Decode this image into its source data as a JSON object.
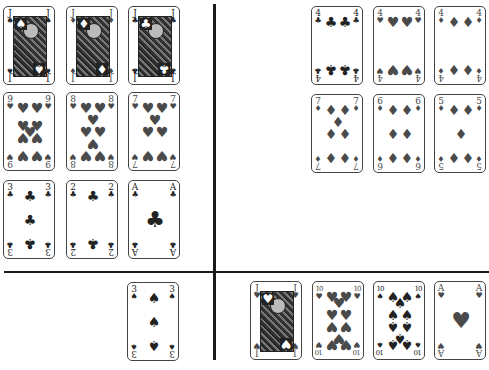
{
  "layout": {
    "divider_vertical": {
      "x": 213
    },
    "divider_horizontal": {
      "y": 271
    }
  },
  "quadrants": {
    "top_left": {
      "rows": [
        [
          {
            "rank": "J",
            "suit": "♠",
            "suit_name": "spades"
          },
          {
            "rank": "J",
            "suit": "♦",
            "suit_name": "diamonds"
          },
          {
            "rank": "J",
            "suit": "♣",
            "suit_name": "clubs"
          }
        ],
        [
          {
            "rank": "9",
            "suit": "♥",
            "suit_name": "hearts"
          },
          {
            "rank": "8",
            "suit": "♥",
            "suit_name": "hearts"
          },
          {
            "rank": "7",
            "suit": "♥",
            "suit_name": "hearts"
          }
        ],
        [
          {
            "rank": "3",
            "suit": "♣",
            "suit_name": "clubs"
          },
          {
            "rank": "2",
            "suit": "♣",
            "suit_name": "clubs"
          },
          {
            "rank": "A",
            "suit": "♣",
            "suit_name": "clubs"
          }
        ]
      ]
    },
    "top_right": {
      "rows": [
        [
          {
            "rank": "4",
            "suit": "♣",
            "suit_name": "clubs"
          },
          {
            "rank": "4",
            "suit": "♥",
            "suit_name": "hearts"
          },
          {
            "rank": "4",
            "suit": "♦",
            "suit_name": "diamonds"
          }
        ],
        [
          {
            "rank": "7",
            "suit": "♦",
            "suit_name": "diamonds"
          },
          {
            "rank": "6",
            "suit": "♦",
            "suit_name": "diamonds"
          },
          {
            "rank": "5",
            "suit": "♦",
            "suit_name": "diamonds"
          }
        ]
      ]
    },
    "bottom_left": {
      "cards": [
        {
          "rank": "3",
          "suit": "♠",
          "suit_name": "spades"
        }
      ]
    },
    "bottom_right": {
      "cards": [
        {
          "rank": "J",
          "suit": "♥",
          "suit_name": "hearts"
        },
        {
          "rank": "10",
          "suit": "♥",
          "suit_name": "hearts"
        },
        {
          "rank": "10",
          "suit": "♠",
          "suit_name": "spades"
        },
        {
          "rank": "A",
          "suit": "♥",
          "suit_name": "hearts"
        }
      ]
    }
  },
  "colors": {
    "ink": "#222222",
    "red_suit_print": "#4a4a4a",
    "divider": "#1a1a1a",
    "background": "#ffffff"
  }
}
